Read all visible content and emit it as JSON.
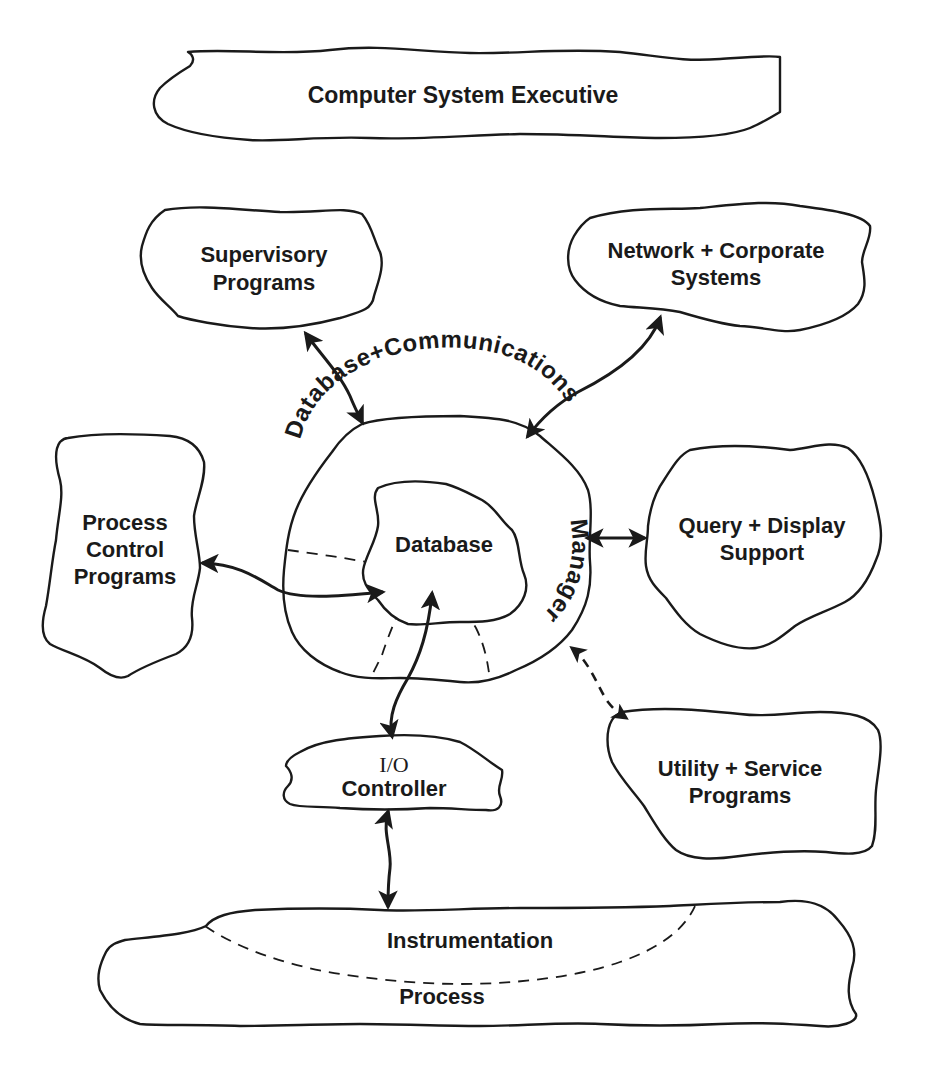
{
  "diagram": {
    "type": "architecture-blob-diagram",
    "colors": {
      "stroke": "#1a1a1a",
      "background": "#ffffff",
      "text": "#1a1a1a"
    },
    "nodes": {
      "executive": {
        "label": "Computer System Executive"
      },
      "supervisory": {
        "line1": "Supervisory",
        "line2": "Programs"
      },
      "network": {
        "line1": "Network + Corporate",
        "line2": "Systems"
      },
      "process_control": {
        "line1": "Process",
        "line2": "Control",
        "line3": "Programs"
      },
      "dbcm": {
        "curved_label_top": "Database+Communications",
        "curved_label_right": "Manager"
      },
      "database": {
        "label": "Database"
      },
      "query": {
        "line1": "Query + Display",
        "line2": "Support"
      },
      "utility": {
        "line1": "Utility + Service",
        "line2": "Programs"
      },
      "io": {
        "line1": "I/O",
        "line2": "Controller"
      },
      "instrumentation": {
        "label": "Instrumentation"
      },
      "process": {
        "label": "Process"
      }
    },
    "edges": [
      {
        "from": "Supervisory Programs",
        "to": "Database+Communications Manager",
        "style": "solid",
        "direction": "bidirectional"
      },
      {
        "from": "Network + Corporate Systems",
        "to": "Database+Communications Manager",
        "style": "solid",
        "direction": "bidirectional"
      },
      {
        "from": "Process Control Programs",
        "to": "Database",
        "style": "solid",
        "direction": "bidirectional"
      },
      {
        "from": "Database+Communications Manager",
        "to": "Query + Display Support",
        "style": "solid",
        "direction": "bidirectional"
      },
      {
        "from": "Database+Communications Manager",
        "to": "Utility + Service Programs",
        "style": "dashed",
        "direction": "bidirectional"
      },
      {
        "from": "I/O Controller",
        "to": "Database",
        "style": "solid",
        "direction": "bidirectional"
      },
      {
        "from": "I/O Controller",
        "to": "Process",
        "style": "solid",
        "direction": "bidirectional"
      }
    ]
  }
}
